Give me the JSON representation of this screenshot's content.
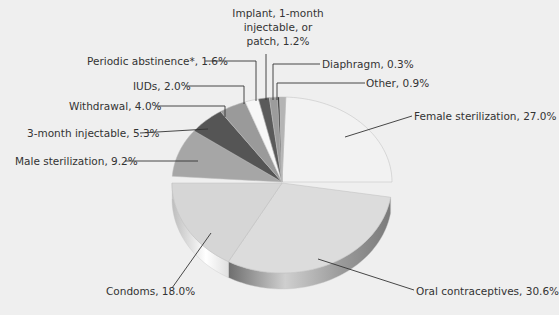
{
  "chart_data": {
    "type": "pie",
    "title": "",
    "style": "3d-exploded-halves",
    "slices": [
      {
        "label": "Female sterilization",
        "value": 27.0,
        "color": "#f2f2f2"
      },
      {
        "label": "Oral contraceptives",
        "value": 30.6,
        "color": "#dcdcdc"
      },
      {
        "label": "Condoms",
        "value": 18.0,
        "color": "#d6d6d6"
      },
      {
        "label": "Male sterilization",
        "value": 9.2,
        "color": "#a6a6a6"
      },
      {
        "label": "3-month injectable",
        "value": 5.3,
        "color": "#555555"
      },
      {
        "label": "Withdrawal",
        "value": 4.0,
        "color": "#9a9a9a"
      },
      {
        "label": "IUDs",
        "value": 2.0,
        "color": "#f7f7f7"
      },
      {
        "label": "Periodic abstinence*",
        "value": 1.6,
        "color": "#5a5a5a"
      },
      {
        "label": "Implant, 1-month injectable, or patch",
        "value": 1.2,
        "color": "#9c9c9c"
      },
      {
        "label": "Diaphragm",
        "value": 0.3,
        "color": "#333333"
      },
      {
        "label": "Other",
        "value": 0.9,
        "color": "#b4b4b4"
      }
    ]
  },
  "labels": {
    "female": "Female sterilization, 27.0%",
    "oral": "Oral contraceptives, 30.6%",
    "condoms": "Condoms, 18.0%",
    "male": "Male sterilization, 9.2%",
    "inject3": "3-month injectable, 5.3%",
    "withdrawal": "Withdrawal, 4.0%",
    "iuds": "IUDs, 2.0%",
    "periodic": "Periodic abstinence*, 1.6%",
    "implant": "Implant, 1-month injectable, or patch, 1.2%",
    "diaphragm": "Diaphragm, 0.3%",
    "other": "Other, 0.9%"
  }
}
